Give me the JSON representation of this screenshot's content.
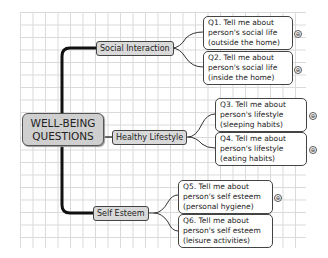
{
  "central": {
    "line1": "WELL-BEING",
    "line2": "QUESTIONS"
  },
  "branches": [
    {
      "label": "Social Interaction"
    },
    {
      "label": "Healthy Lifestyle"
    },
    {
      "label": "Self Esteem"
    }
  ],
  "questions": [
    {
      "line1": "Q1. Tell me about",
      "line2": "person's social life",
      "line3": "(outside the home)"
    },
    {
      "line1": "Q2. Tell me about",
      "line2": "person's social life",
      "line3": "(inside the home)"
    },
    {
      "line1": "Q3. Tell me about",
      "line2": "person's lifestyle",
      "line3": "(sleeping habits)"
    },
    {
      "line1": "Q4. Tell me about",
      "line2": "person's lifestyle",
      "line3": "(eating habits)"
    },
    {
      "line1": "Q5. Tell me about",
      "line2": "person's self esteem",
      "line3": "(personal hygiene)"
    },
    {
      "line1": "Q6. Tell me about",
      "line2": "person's self esteem",
      "line3": "(leisure activities)"
    }
  ],
  "icons": {
    "expand": "⊕"
  }
}
